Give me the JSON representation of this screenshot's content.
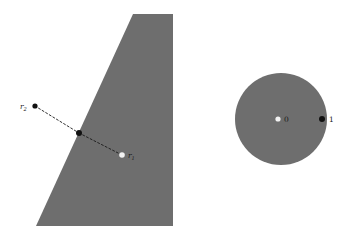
{
  "figure": {
    "background_color": "#ffffff",
    "width": 350,
    "height": 238
  },
  "colors": {
    "region_fill": "#6e6e6e",
    "point_dark": "#111111",
    "point_light": "#f2f2f2",
    "ray_stroke": "#1a1a1a",
    "label_color": "#1a1a1a"
  },
  "shapes": {
    "wedge": {
      "name": "gray-wedge-region",
      "fill": "#6e6e6e",
      "points": "133,14 173,14 173,226 36,226"
    },
    "disk": {
      "name": "gray-disk-region",
      "fill": "#6e6e6e",
      "cx": 281,
      "cy": 119,
      "r": 46
    }
  },
  "ray": {
    "name": "dashed-ray",
    "dash_pattern": "2 2.2",
    "stroke_width": 0.9,
    "segments": [
      {
        "label": "outside-segment",
        "x1": 35,
        "y1": 106,
        "x2": 79,
        "y2": 133
      },
      {
        "label": "inside-segment",
        "x1": 79,
        "y1": 133,
        "x2": 122,
        "y2": 155
      }
    ]
  },
  "points": [
    {
      "id": "r2",
      "name": "point-r2",
      "label": "r",
      "subscript": "2",
      "x": 35,
      "y": 106,
      "radius": 2.6,
      "style": "dark",
      "label_x": 20,
      "label_y": 109,
      "label_anchor": "start"
    },
    {
      "id": "intersection",
      "name": "point-intersection",
      "label": "",
      "subscript": "",
      "x": 79,
      "y": 133,
      "radius": 3.0,
      "style": "dark",
      "label_x": 0,
      "label_y": 0,
      "label_anchor": "start"
    },
    {
      "id": "r1",
      "name": "point-r1",
      "label": "r",
      "subscript": "1",
      "x": 122,
      "y": 155,
      "radius": 2.8,
      "style": "light",
      "label_x": 128,
      "label_y": 158,
      "label_anchor": "start"
    },
    {
      "id": "disk_center",
      "name": "point-disk-center",
      "label": "0",
      "subscript": "",
      "x": 278,
      "y": 119,
      "radius": 2.6,
      "style": "light",
      "label_x": 284,
      "label_y": 122,
      "label_anchor": "start"
    },
    {
      "id": "disk_boundary",
      "name": "point-disk-boundary",
      "label": "1",
      "subscript": "",
      "x": 322,
      "y": 119,
      "radius": 3.0,
      "style": "dark",
      "label_x": 329,
      "label_y": 122,
      "label_anchor": "start"
    }
  ],
  "labels": {
    "r2_text": "r",
    "r2_sub": "2",
    "r1_text": "r",
    "r1_sub": "1",
    "zero_text": "0",
    "one_text": "1"
  }
}
